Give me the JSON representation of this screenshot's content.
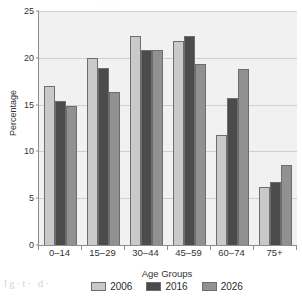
{
  "chart_data": {
    "type": "bar",
    "title": "",
    "xlabel": "Age Groups",
    "ylabel": "Percentage",
    "categories": [
      "0–14",
      "15–29",
      "30–44",
      "45–59",
      "60–74",
      "75+"
    ],
    "ylim": [
      0,
      25
    ],
    "yticks": [
      0,
      5,
      10,
      15,
      20,
      25
    ],
    "ytick_labels": [
      "0",
      "5",
      "10",
      "15",
      "20",
      "25"
    ],
    "grid": true,
    "legend_position": "bottom",
    "series": [
      {
        "name": "2006",
        "color": "#c9c9c9",
        "values": [
          17.0,
          20.0,
          22.3,
          21.8,
          11.8,
          6.2
        ]
      },
      {
        "name": "2016",
        "color": "#4b4b4b",
        "values": [
          15.4,
          18.9,
          20.8,
          22.3,
          15.7,
          6.7
        ]
      },
      {
        "name": "2026",
        "color": "#919191",
        "values": [
          14.9,
          16.3,
          20.8,
          19.3,
          18.8,
          8.6
        ]
      }
    ]
  },
  "scan_artifacts": {
    "top": "·  ·        ·",
    "bottom": "lg·t· d·"
  },
  "colors": {
    "plot_background": "#f1f1f1",
    "axis": "#8d8d8d",
    "grid": "#cfcfcf",
    "text": "#2b2b2b"
  }
}
